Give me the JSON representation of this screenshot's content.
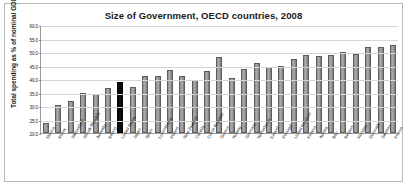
{
  "chart_data": {
    "type": "bar",
    "title": "Size of Government, OECD countries, 2008",
    "xlabel": "",
    "ylabel": "Total spending as % of nominal GDP",
    "ylim": [
      20.0,
      60.0
    ],
    "yticks": [
      "20.0",
      "25.0",
      "30.0",
      "35.0",
      "40.0",
      "45.0",
      "50.0",
      "55.0",
      "60.0"
    ],
    "grid": true,
    "legend": "none",
    "highlight_color": "#0d0d0d",
    "bar_color": "#9a9a9a",
    "highlighted_category": "United States",
    "categories": [
      "Mexico",
      "Korea",
      "Switzerland",
      "Slovak Republic",
      "Australia",
      "Ireland",
      "United States",
      "Japan",
      "Spain",
      "Luxembourg",
      "Poland",
      "New Zealand",
      "Canada",
      "Czech Republic",
      "Greece",
      "Norway",
      "Germany",
      "Netherlands",
      "Iceland",
      "Portugal",
      "United Kingdom",
      "Finland",
      "Austria",
      "Italy",
      "Belgium",
      "Hungary",
      "Denmark",
      "Sweden",
      "France"
    ],
    "values": [
      23.6,
      30.4,
      32.0,
      34.9,
      34.3,
      36.7,
      38.8,
      37.1,
      41.1,
      41.2,
      43.2,
      41.1,
      39.7,
      42.9,
      48.3,
      40.2,
      43.8,
      45.9,
      44.5,
      44.8,
      47.5,
      49.0,
      48.7,
      48.8,
      50.1,
      49.2,
      51.8,
      51.7,
      52.7
    ]
  }
}
